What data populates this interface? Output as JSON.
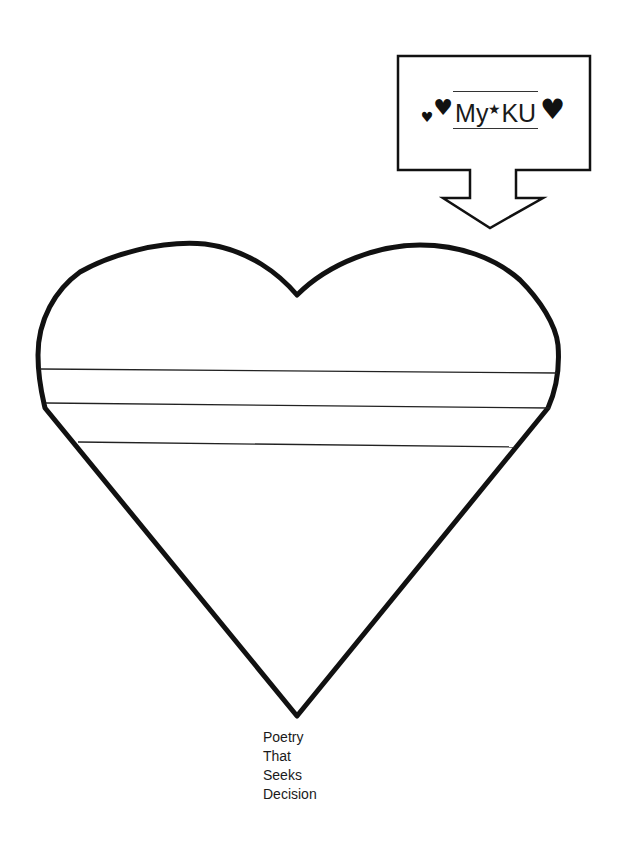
{
  "title_box": {
    "prefix": "My",
    "star": "★",
    "suffix": "KU",
    "left_hearts": [
      "♥",
      "♥"
    ],
    "right_heart": "♥"
  },
  "caption": {
    "lines": [
      "Poetry",
      "That",
      "Seeks",
      "Decision"
    ]
  },
  "heart_worksheet": {
    "writing_lines": 3
  }
}
